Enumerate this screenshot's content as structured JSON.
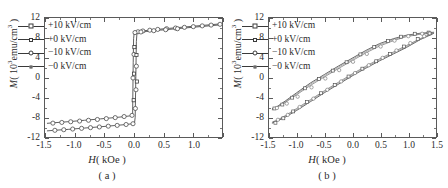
{
  "figure": {
    "panels": [
      {
        "id": "a",
        "caption": "( a )",
        "legend": [
          {
            "label": "+10 kV/cm",
            "marker": "square"
          },
          {
            "label": "+0 kV/cm",
            "marker": "triangle"
          },
          {
            "label": "−10 kV/cm",
            "marker": "circle"
          },
          {
            "label": "−0 kV/cm",
            "marker": "line"
          }
        ]
      },
      {
        "id": "b",
        "caption": "( b )",
        "legend": [
          {
            "label": "+10 kV/cm",
            "marker": "square"
          },
          {
            "label": "+0 kV/cm",
            "marker": "triangle"
          },
          {
            "label": "−10 kV/cm",
            "marker": "circle"
          },
          {
            "label": "−0 kV/cm",
            "marker": "line"
          }
        ]
      }
    ],
    "axis": {
      "x_title_symbol": "H",
      "x_title_unit": "( kOe )",
      "y_title_symbol": "M",
      "y_title_unit_pre": "( 10",
      "y_title_unit_sup": "3",
      "y_title_unit_post": "emu/cm",
      "y_title_unit_sup2": "3",
      "y_title_unit_end": " )",
      "x_ticks": [
        "-1.5",
        "-1.0",
        "-0.5",
        "0.0",
        "0.5",
        "1.0",
        "1.5"
      ],
      "y_ticks": [
        "12",
        "8",
        "4",
        "0",
        "-4",
        "-8",
        "-12"
      ]
    }
  },
  "chart_data": [
    {
      "type": "line",
      "panel": "a",
      "title": "( a )",
      "xlabel": "H( kOe )",
      "ylabel": "M( 10^3 emu/cm^3 )",
      "xlim": [
        -1.5,
        1.5
      ],
      "ylim": [
        -12,
        12
      ],
      "xticks": [
        -1.5,
        -1.0,
        -0.5,
        0.0,
        0.5,
        1.0,
        1.5
      ],
      "yticks": [
        -12,
        -8,
        -4,
        0,
        4,
        8,
        12
      ],
      "grid": false,
      "legend_position": "upper-left",
      "description": "Square magnetic hysteresis loop with sharp switching near H = 0, saturation magnetization about 11.5 x 10^3 emu/cm^3, coercive field about 0.04 kOe",
      "series": [
        {
          "name": "+10 kV/cm",
          "marker": "square",
          "branch_descending": {
            "x": [
              1.5,
              1.25,
              1.0,
              0.75,
              0.5,
              0.3,
              0.15,
              0.05,
              0.02,
              0.0,
              -0.02,
              -0.035,
              -0.045,
              -0.05,
              -0.06,
              -0.1,
              -0.2,
              -0.4,
              -0.6,
              -0.85,
              -1.1,
              -1.3,
              -1.5
            ],
            "y": [
              11.5,
              11.3,
              11.1,
              10.9,
              10.6,
              10.4,
              10.2,
              10.0,
              9.9,
              9.85,
              9.8,
              9.7,
              6.0,
              -1.5,
              -9.5,
              -9.8,
              -10.0,
              -10.2,
              -10.4,
              -10.7,
              -11.0,
              -11.25,
              -11.5
            ]
          },
          "branch_ascending": {
            "x": [
              -1.5,
              -1.3,
              -1.1,
              -0.85,
              -0.6,
              -0.4,
              -0.2,
              -0.1,
              -0.05,
              -0.02,
              0.0,
              0.02,
              0.035,
              0.045,
              0.05,
              0.06,
              0.1,
              0.2,
              0.4,
              0.6,
              0.85,
              1.1,
              1.3,
              1.5
            ],
            "y": [
              -11.5,
              -11.25,
              -11.0,
              -10.7,
              -10.4,
              -10.2,
              -10.0,
              -9.9,
              -9.85,
              -9.8,
              -9.75,
              -9.7,
              -5.0,
              1.5,
              6.5,
              9.6,
              9.9,
              10.1,
              10.4,
              10.6,
              10.9,
              11.1,
              11.3,
              11.5
            ]
          }
        },
        {
          "name": "+0 kV/cm",
          "marker": "triangle",
          "note": "overlaps +10 kV/cm loop; coercive field marginally different"
        },
        {
          "name": "-10 kV/cm",
          "marker": "circle",
          "note": "overlaps; open circle markers visible along saturation arms"
        },
        {
          "name": "-0 kV/cm",
          "marker": "line",
          "note": "overlaps the other three loops"
        }
      ]
    },
    {
      "type": "line",
      "panel": "b",
      "title": "( b )",
      "xlabel": "H( kOe )",
      "ylabel": "M( 10^3 emu/cm^3 )",
      "xlim": [
        -1.5,
        1.5
      ],
      "ylim": [
        -12,
        12
      ],
      "xticks": [
        -1.5,
        -1.0,
        -0.5,
        0.0,
        0.5,
        1.0,
        1.5
      ],
      "yticks": [
        -12,
        -8,
        -4,
        0,
        4,
        8,
        12
      ],
      "grid": false,
      "legend_position": "upper-left",
      "description": "Slanted S-shaped hysteresis loop with gradual approach to saturation, saturation magnetization about 9.3 x 10^3 emu/cm^3, narrow loop opening between -1.0 and 1.0 kOe",
      "series": [
        {
          "name": "+10 kV/cm",
          "marker": "square",
          "branch_descending": {
            "x": [
              1.5,
              1.25,
              1.0,
              0.8,
              0.6,
              0.45,
              0.3,
              0.15,
              0.0,
              -0.15,
              -0.3,
              -0.45,
              -0.6,
              -0.8,
              -1.0,
              -1.25,
              -1.5
            ],
            "y": [
              9.3,
              9.1,
              8.6,
              7.8,
              6.5,
              5.3,
              3.8,
              2.2,
              0.5,
              -1.3,
              -3.0,
              -4.5,
              -5.9,
              -7.3,
              -8.4,
              -9.0,
              -9.3
            ]
          },
          "branch_ascending": {
            "x": [
              -1.5,
              -1.25,
              -1.0,
              -0.8,
              -0.6,
              -0.45,
              -0.3,
              -0.15,
              0.0,
              0.15,
              0.3,
              0.45,
              0.6,
              0.8,
              1.0,
              1.25,
              1.5
            ],
            "y": [
              -9.3,
              -9.1,
              -8.6,
              -7.8,
              -6.6,
              -5.5,
              -4.0,
              -2.4,
              -0.6,
              1.2,
              2.9,
              4.4,
              5.8,
              7.2,
              8.3,
              9.0,
              9.3
            ]
          }
        },
        {
          "name": "+0 kV/cm",
          "marker": "triangle",
          "note": "slightly narrower loop, overlapping"
        },
        {
          "name": "-10 kV/cm",
          "marker": "circle",
          "note": "slightly wider loop, overlapping"
        },
        {
          "name": "-0 kV/cm",
          "marker": "line",
          "note": "overlapping"
        }
      ]
    }
  ]
}
